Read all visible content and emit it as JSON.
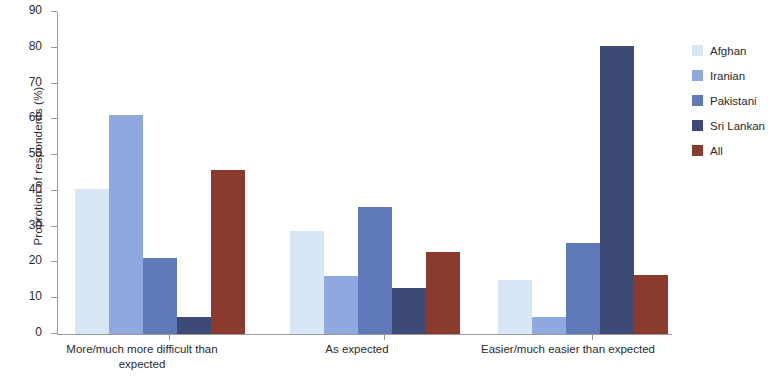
{
  "chart_data": {
    "type": "bar",
    "title": "",
    "xlabel": "",
    "ylabel": "Proprotion of respondents (%)",
    "ylim": [
      0,
      90
    ],
    "ytick_step": 10,
    "yticks": [
      0,
      10,
      20,
      30,
      40,
      50,
      60,
      70,
      80,
      90
    ],
    "grid": false,
    "legend_position": "right",
    "categories": [
      "More/much more difficult than expected",
      "As expected",
      "Easier/much easier than expected"
    ],
    "category_lines": [
      [
        "More/much more difficult than",
        "expected"
      ],
      [
        "As expected"
      ],
      [
        "Easier/much easier than expected"
      ]
    ],
    "series": [
      {
        "name": "Afghan",
        "color": "#d6e6f4",
        "values": [
          40.5,
          28.8,
          15.0
        ]
      },
      {
        "name": "Iranian",
        "color": "#8fa9e0",
        "values": [
          61.2,
          16.2,
          4.8
        ]
      },
      {
        "name": "Pakistani",
        "color": "#6079b8",
        "values": [
          21.2,
          35.4,
          25.5
        ]
      },
      {
        "name": "Sri Lankan",
        "color": "#3d4a75",
        "values": [
          4.8,
          12.8,
          80.5
        ]
      },
      {
        "name": "All",
        "color": "#8b3a2e",
        "values": [
          45.8,
          22.8,
          16.5
        ]
      }
    ]
  }
}
